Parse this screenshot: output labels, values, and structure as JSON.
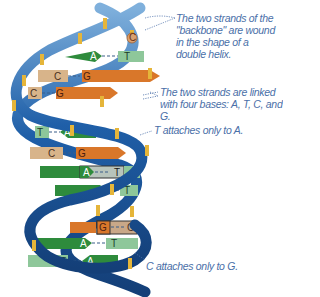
{
  "annotations": {
    "backbone": "The two strands of the \"backbone\" are wound in the shape of a double helix.",
    "bases": "The two strands are linked with four bases: A, T, C, and G.",
    "t_to_a": "T attaches only to A.",
    "c_to_g": "C attaches only to G."
  },
  "colors": {
    "backbone_blue": "#1f5fa8",
    "backbone_dark": "#143f78",
    "backbone_light": "#7fb0dc",
    "stripe_gold": "#e5b53a",
    "adenine_green": "#2e8b3c",
    "thymine_lightgreen": "#8ec79a",
    "guanine_orange": "#d9772a",
    "cytosine_tan": "#d8b48a",
    "label_blue": "#4a6fa8"
  },
  "base_pairs": [
    {
      "left": "A",
      "right": "T",
      "left_type": "adenine",
      "right_type": "thymine"
    },
    {
      "left": "C",
      "right": "G",
      "left_type": "cytosine",
      "right_type": "guanine"
    },
    {
      "left": "C",
      "right": "G",
      "left_type": "cytosine",
      "right_type": "guanine"
    },
    {
      "left": "T",
      "right": "A",
      "left_type": "thymine",
      "right_type": "adenine"
    },
    {
      "left": "C",
      "right": "G",
      "left_type": "cytosine",
      "right_type": "guanine"
    },
    {
      "left": "A",
      "right": "T",
      "left_type": "adenine",
      "right_type": "thymine"
    },
    {
      "left": "A",
      "right": "T",
      "left_type": "adenine",
      "right_type": "thymine"
    },
    {
      "left": "G",
      "right": "C",
      "left_type": "guanine",
      "right_type": "cytosine"
    },
    {
      "left": "A",
      "right": "T",
      "left_type": "adenine",
      "right_type": "thymine"
    },
    {
      "left": "T",
      "right": "A",
      "left_type": "thymine",
      "right_type": "adenine"
    }
  ],
  "letters": {
    "p0l": "A",
    "p0r": "T",
    "p1l": "C",
    "p1r": "G",
    "p2l": "C",
    "p2r": "G",
    "p3l": "T",
    "p3r": "A",
    "p4l": "C",
    "p4r": "G",
    "p5l": "A",
    "p5r": "T",
    "p6l": "A",
    "p6r": "T",
    "p7l": "G",
    "p7r": "C",
    "p8l": "A",
    "p8r": "T",
    "p9l": "T",
    "p9r": "A",
    "top_c": "C"
  }
}
